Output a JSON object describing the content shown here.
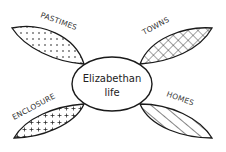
{
  "diagram": {
    "type": "mind-map",
    "center": {
      "line1": "Elizabethan",
      "line2": "life"
    },
    "branches": [
      {
        "label": "PASTIMES",
        "position": "top-left",
        "pattern": "dots"
      },
      {
        "label": "TOWNS",
        "position": "top-right",
        "pattern": "diagonal-grid"
      },
      {
        "label": "ENCLOSURE",
        "position": "bottom-left",
        "pattern": "crosses"
      },
      {
        "label": "HOMES",
        "position": "bottom-right",
        "pattern": "diagonal-stripes"
      }
    ],
    "colors": {
      "stroke": "#1a1a1a",
      "background": "#ffffff"
    }
  }
}
